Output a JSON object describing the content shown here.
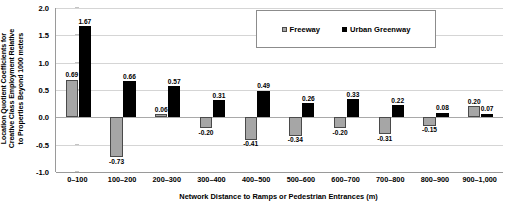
{
  "chart_data": {
    "type": "bar",
    "title": "",
    "xlabel": "Network Distance to Ramps or Pedestrian Entrances (m)",
    "ylabel": "Location Quotient Coefficients for Creative Class Employment Relative to Properties Beyond 1000 meters",
    "ylabel_lines": [
      "Location Quotient Coefficients for",
      "Creative Class Employment Relative",
      "to Properties Beyond 1000 meters"
    ],
    "categories": [
      "0–100",
      "100–200",
      "200–300",
      "300–400",
      "400–500",
      "500–600",
      "600–700",
      "700–800",
      "800–900",
      "900–1,000"
    ],
    "series": [
      {
        "name": "Freeway",
        "color": "#a6a6a6",
        "values": [
          0.69,
          -0.73,
          0.06,
          -0.2,
          -0.41,
          -0.34,
          -0.2,
          -0.31,
          -0.15,
          0.2
        ],
        "labels": [
          "0.69",
          "-0.73",
          "0.06",
          "-0.20",
          "-0.41",
          "-0.34",
          "-0.20",
          "-0.31",
          "-0.15",
          "0.20"
        ]
      },
      {
        "name": "Urban Greenway",
        "color": "#000000",
        "values": [
          1.67,
          0.66,
          0.57,
          0.31,
          0.49,
          0.26,
          0.33,
          0.22,
          0.08,
          0.07
        ],
        "labels": [
          "1.67",
          "0.66",
          "0.57",
          "0.31",
          "0.49",
          "0.26",
          "0.33",
          "0.22",
          "0.08",
          "0.07"
        ]
      }
    ],
    "ylim": [
      -1.0,
      2.0
    ],
    "yticks": [
      2.0,
      1.5,
      1.0,
      0.5,
      0.0,
      -0.5,
      -1.0
    ],
    "ytick_labels": [
      "2.0",
      "1.5",
      "1.0",
      "0.5",
      "0.0",
      "-0.5",
      "-1.0"
    ],
    "grid": true,
    "legend_position": "top-center",
    "legend_entries": [
      "Freeway",
      "Urban Greenway"
    ]
  }
}
